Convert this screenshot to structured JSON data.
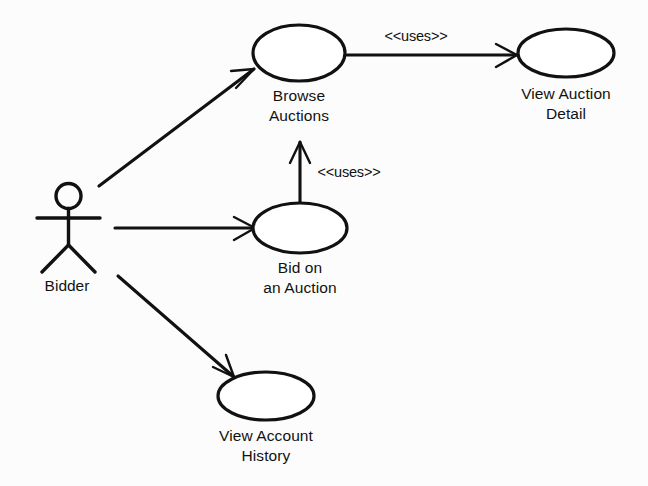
{
  "diagram": {
    "type": "uml-use-case-diagram",
    "background_color": "#fcfcfc",
    "stroke_color": "#111111",
    "fill_color": "#ffffff",
    "actors": [
      {
        "id": "bidder",
        "label": "Bidder",
        "x": 68,
        "y": 228
      }
    ],
    "use_cases": [
      {
        "id": "browse-auctions",
        "label_line1": "Browse",
        "label_line2": "Auctions",
        "cx": 299,
        "cy": 53,
        "rx": 47,
        "ry": 28
      },
      {
        "id": "view-auction-detail",
        "label_line1": "View Auction",
        "label_line2": "Detail",
        "cx": 566,
        "cy": 53,
        "rx": 48,
        "ry": 24
      },
      {
        "id": "bid-on-an-auction",
        "label_line1": "Bid on",
        "label_line2": "an Auction",
        "cx": 300,
        "cy": 228,
        "rx": 47,
        "ry": 25
      },
      {
        "id": "view-account-history",
        "label_line1": "View Account",
        "label_line2": "History",
        "cx": 266,
        "cy": 396,
        "rx": 48,
        "ry": 24
      }
    ],
    "relationships": [
      {
        "id": "bidder-to-browse-auctions",
        "from": "bidder",
        "to": "browse-auctions",
        "kind": "association",
        "stereotype": ""
      },
      {
        "id": "bidder-to-bid-on-an-auction",
        "from": "bidder",
        "to": "bid-on-an-auction",
        "kind": "association",
        "stereotype": ""
      },
      {
        "id": "bidder-to-view-account-history",
        "from": "bidder",
        "to": "view-account-history",
        "kind": "association",
        "stereotype": ""
      },
      {
        "id": "browse-auctions-uses-view-auction-detail",
        "from": "browse-auctions",
        "to": "view-auction-detail",
        "kind": "uses",
        "stereotype": "<<uses>>",
        "label_x": 416,
        "label_y": 41
      },
      {
        "id": "bid-on-an-auction-uses-browse-auctions",
        "from": "bid-on-an-auction",
        "to": "browse-auctions",
        "kind": "uses",
        "stereotype": "<<uses>>",
        "label_x": 349,
        "label_y": 177
      }
    ]
  }
}
